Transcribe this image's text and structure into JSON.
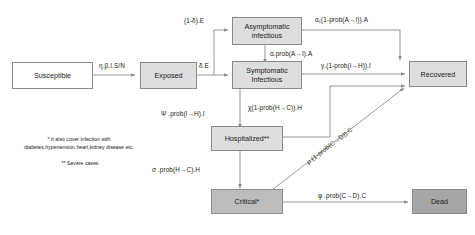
{
  "diagram": {
    "colors": {
      "box_white": "#ffffff",
      "box_light_gray": "#dedede",
      "box_mid_gray": "#bdbdbd",
      "box_dark_gray": "#a6a6a6",
      "border": "#8a8a8a",
      "arrow": "#8c8c8c",
      "text": "#1a1a1a"
    },
    "nodes": [
      {
        "id": "susceptible",
        "label": "Susceptible",
        "fill": "white"
      },
      {
        "id": "exposed",
        "label": "Exposed",
        "fill": "light"
      },
      {
        "id": "asymptomatic",
        "label": "Asymptomatic\ninfectious",
        "fill": "light"
      },
      {
        "id": "symptomatic",
        "label": "Symptomatic\nInfectious",
        "fill": "light"
      },
      {
        "id": "hospitalized",
        "label": "Hospitalized**",
        "fill": "light"
      },
      {
        "id": "critical",
        "label": "Critical*",
        "fill": "mid"
      },
      {
        "id": "recovered",
        "label": "Recovered",
        "fill": "light"
      },
      {
        "id": "dead",
        "label": "Dead",
        "fill": "dark"
      }
    ],
    "edges": [
      {
        "id": "s-to-e",
        "from": "susceptible",
        "to": "exposed",
        "label": "η.β.I.S/N"
      },
      {
        "id": "e-to-a",
        "from": "exposed",
        "to": "asymptomatic",
        "label": "(1-δ).E"
      },
      {
        "id": "e-to-i",
        "from": "exposed",
        "to": "symptomatic",
        "label": "δ.E"
      },
      {
        "id": "a-to-i",
        "from": "asymptomatic",
        "to": "symptomatic",
        "label": "α.prob(A→I).A"
      },
      {
        "id": "a-to-r",
        "from": "asymptomatic",
        "to": "recovered",
        "label": "α₁(1-prob(A→I)).A"
      },
      {
        "id": "i-to-r",
        "from": "symptomatic",
        "to": "recovered",
        "label": "γ.(1-prob(I→H)).I"
      },
      {
        "id": "i-to-h",
        "from": "symptomatic",
        "to": "hospitalized",
        "label": "Ψ .prob(I→H).I"
      },
      {
        "id": "h-to-r",
        "from": "hospitalized",
        "to": "recovered",
        "label": "χ(1-prob(H→C)).H"
      },
      {
        "id": "h-to-c",
        "from": "hospitalized",
        "to": "critical",
        "label": "σ .prob(H→C).H"
      },
      {
        "id": "c-to-r",
        "from": "critical",
        "to": "recovered",
        "label": "μ.(1-prob(C→D)).C"
      },
      {
        "id": "c-to-d",
        "from": "critical",
        "to": "dead",
        "label": "φ .prob(C→D).C"
      }
    ],
    "footnotes": {
      "single_star": "* It also cover infection with\ndiabetes,hypertension,heart,kidney disease etc.",
      "double_star": "** Severe cases"
    }
  }
}
